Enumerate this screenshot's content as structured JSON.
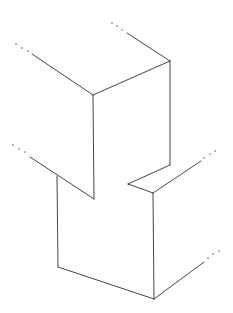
{
  "diagram": {
    "type": "isometric-line-drawing",
    "canvas": {
      "width": 233,
      "height": 313,
      "background": "#ffffff",
      "stroke": "#444444"
    },
    "edges": [
      {
        "id": "top-left-edge",
        "points": [
          [
            32,
            54
          ],
          [
            93,
            95
          ]
        ]
      },
      {
        "id": "top-right-edge",
        "points": [
          [
            127,
            33
          ],
          [
            170,
            61
          ]
        ]
      },
      {
        "id": "top-front-edge",
        "points": [
          [
            93,
            95
          ],
          [
            170,
            61
          ]
        ]
      },
      {
        "id": "upper-left-vertical",
        "points": [
          [
            93,
            95
          ],
          [
            94,
            199
          ]
        ]
      },
      {
        "id": "upper-right-vertical",
        "points": [
          [
            170,
            61
          ],
          [
            170,
            165
          ]
        ]
      },
      {
        "id": "notch-left-diagonal",
        "points": [
          [
            30,
            157
          ],
          [
            94,
            199
          ]
        ]
      },
      {
        "id": "notch-right-upper",
        "points": [
          [
            170,
            165
          ],
          [
            128,
            184
          ]
        ]
      },
      {
        "id": "notch-right-lower",
        "points": [
          [
            128,
            184
          ],
          [
            153,
            193
          ]
        ]
      },
      {
        "id": "mid-right-edge",
        "points": [
          [
            153,
            193
          ],
          [
            201,
            161
          ]
        ]
      },
      {
        "id": "lower-left-vertical",
        "points": [
          [
            57,
            176
          ],
          [
            58,
            267
          ]
        ]
      },
      {
        "id": "lower-right-vertical",
        "points": [
          [
            153,
            193
          ],
          [
            154,
            299
          ]
        ]
      },
      {
        "id": "bottom-front-edge",
        "points": [
          [
            58,
            267
          ],
          [
            154,
            299
          ]
        ]
      },
      {
        "id": "bottom-right-edge",
        "points": [
          [
            154,
            299
          ],
          [
            204,
            262
          ]
        ]
      }
    ],
    "continuation_dots": [
      {
        "id": "dots-top-left",
        "points": [
          [
            16,
            44
          ],
          [
            22,
            48
          ],
          [
            28,
            51
          ]
        ]
      },
      {
        "id": "dots-top-right",
        "points": [
          [
            112,
            23
          ],
          [
            117,
            26
          ],
          [
            122,
            30
          ]
        ]
      },
      {
        "id": "dots-mid-left",
        "points": [
          [
            13,
            145
          ],
          [
            19,
            149
          ],
          [
            25,
            152
          ]
        ]
      },
      {
        "id": "dots-mid-right",
        "points": [
          [
            204,
            158
          ],
          [
            210,
            154
          ],
          [
            215,
            151
          ]
        ]
      },
      {
        "id": "dots-bottom-right",
        "points": [
          [
            208,
            258
          ],
          [
            213,
            254
          ],
          [
            219,
            251
          ]
        ]
      }
    ]
  }
}
